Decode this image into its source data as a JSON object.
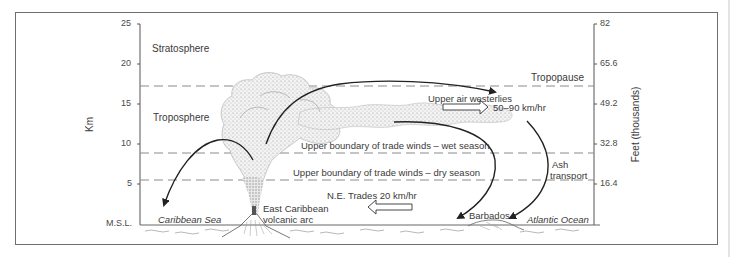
{
  "diagram": {
    "left_axis": {
      "label": "Km",
      "ticks": [
        "25",
        "20",
        "15",
        "10",
        "5",
        "M.S.L."
      ]
    },
    "right_axis": {
      "label": "Feet (thousands)",
      "ticks": [
        "82",
        "65.6",
        "49.2",
        "32.8",
        "16.4"
      ]
    },
    "layers": {
      "stratosphere": "Stratosphere",
      "troposphere": "Troposphere",
      "tropopause": "Tropopause"
    },
    "boundaries": {
      "wet": "Upper boundary of trade winds – wet season",
      "dry": "Upper boundary of trade winds – dry season"
    },
    "winds": {
      "westerlies_label": "Upper air westerlies",
      "westerlies_speed": "50–90 km/hr",
      "trades_label": "N.E. Trades 20 km/hr"
    },
    "ash": {
      "line1": "Ash",
      "line2": "transport"
    },
    "places": {
      "caribbean_sea": "Caribbean Sea",
      "volcano_line1": "East Caribbean",
      "volcano_line2": "volcanic arc",
      "barbados": "Barbados",
      "atlantic": "Atlantic Ocean"
    }
  }
}
